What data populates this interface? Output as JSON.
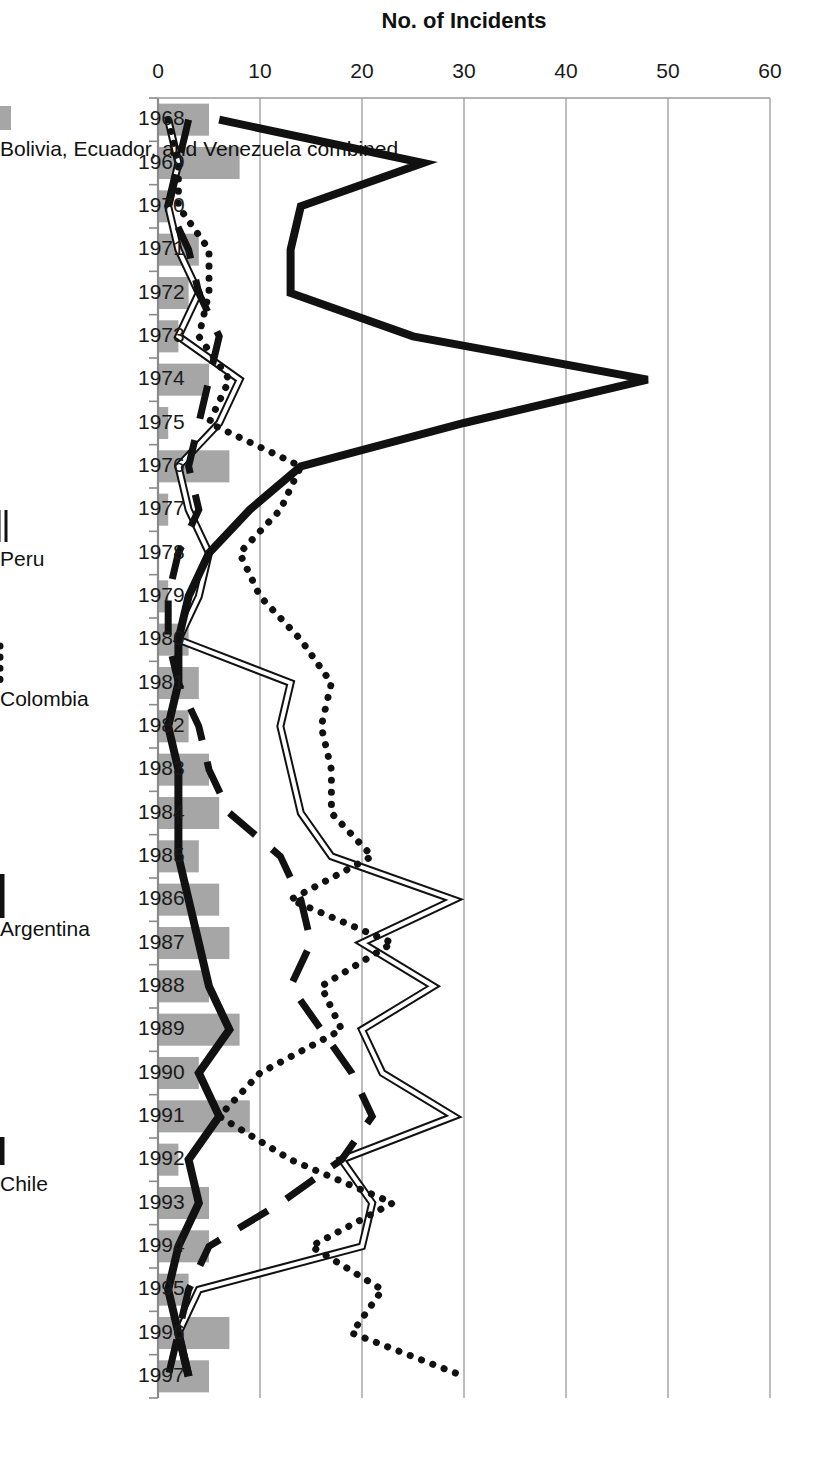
{
  "chart_data": {
    "type": "line",
    "title": "",
    "xlabel": "",
    "ylabel": "No. of Incidents",
    "ylim": [
      0,
      60
    ],
    "ytick_values": [
      0,
      10,
      20,
      30,
      40,
      50,
      60
    ],
    "ytick_labels": [
      "0",
      "10",
      "20",
      "30",
      "40",
      "50",
      "60"
    ],
    "grid": true,
    "legend_position": "bottom",
    "orientation": "rotated-90-clockwise",
    "categories": [
      "1968",
      "1969",
      "1970",
      "1971",
      "1972",
      "1973",
      "1974",
      "1975",
      "1976",
      "1977",
      "1978",
      "1979",
      "1980",
      "1981",
      "1982",
      "1983",
      "1984",
      "1985",
      "1986",
      "1987",
      "1988",
      "1989",
      "1990",
      "1991",
      "1992",
      "1993",
      "1994",
      "1995",
      "1996",
      "1997"
    ],
    "series": [
      {
        "name": "Bolivia, Ecuador, and Venezuela combined",
        "kind": "bar",
        "color": "#a6a6a6",
        "values": [
          5,
          8,
          1,
          4,
          3,
          2,
          5,
          1,
          7,
          1,
          0,
          1,
          3,
          4,
          3,
          5,
          6,
          4,
          6,
          7,
          5,
          8,
          4,
          9,
          2,
          5,
          5,
          3,
          7,
          5
        ]
      },
      {
        "name": "Peru",
        "kind": "line",
        "style": "double",
        "color": "#111111",
        "values": [
          1,
          2,
          1,
          2,
          4,
          2,
          8,
          6,
          2,
          3,
          5,
          4,
          2,
          13,
          12,
          13,
          14,
          17,
          29,
          20,
          27,
          20,
          22,
          29,
          18,
          21,
          20,
          4,
          2,
          3
        ]
      },
      {
        "name": "Colombia",
        "kind": "line",
        "style": "dotted",
        "color": "#111111",
        "values": [
          1,
          2,
          2,
          5,
          5,
          4,
          7,
          5,
          14,
          12,
          8,
          10,
          14,
          17,
          16,
          17,
          17,
          21,
          13,
          23,
          16,
          18,
          10,
          6,
          13,
          23,
          15,
          22,
          19,
          30
        ]
      },
      {
        "name": "Argentina",
        "kind": "line",
        "style": "solid-thick",
        "color": "#111111",
        "values": [
          6,
          26,
          14,
          13,
          13,
          25,
          48,
          30,
          14,
          9,
          5,
          3,
          2,
          2,
          1,
          2,
          2,
          2,
          3,
          4,
          5,
          7,
          4,
          6,
          3,
          4,
          2,
          1,
          2,
          3
        ]
      },
      {
        "name": "Chile",
        "kind": "line",
        "style": "dashed",
        "color": "#111111",
        "values": [
          3,
          2,
          1,
          3,
          4,
          6,
          5,
          4,
          3,
          4,
          2,
          1,
          1,
          2,
          4,
          5,
          7,
          12,
          14,
          15,
          13,
          16,
          19,
          21,
          18,
          12,
          5,
          3,
          2,
          1
        ]
      }
    ]
  },
  "legend": {
    "items": [
      {
        "label": "Bolivia, Ecuador, and Venezuela combined",
        "marker": "bar-swatch"
      },
      {
        "label": "Peru",
        "marker": "double-line"
      },
      {
        "label": "Colombia",
        "marker": "dotted-line"
      },
      {
        "label": "Argentina",
        "marker": "thick-line"
      },
      {
        "label": "Chile",
        "marker": "solid-line"
      }
    ]
  },
  "axis": {
    "y_title": "No. of Incidents"
  }
}
